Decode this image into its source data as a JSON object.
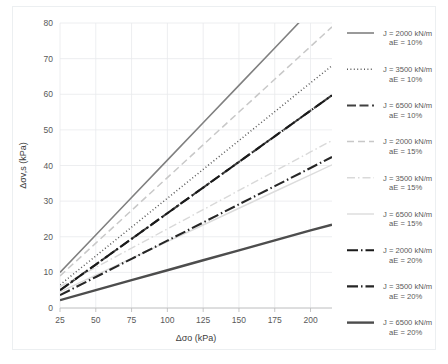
{
  "chart_data": {
    "type": "line",
    "title": "",
    "xlabel": "Δσo (kPa)",
    "ylabel": "Δσv,s (kPa)",
    "xlim": [
      25,
      215
    ],
    "ylim": [
      0,
      80
    ],
    "xticks": [
      25,
      50,
      75,
      100,
      125,
      150,
      175,
      200
    ],
    "yticks": [
      0,
      10,
      20,
      30,
      40,
      50,
      60,
      70,
      80
    ],
    "grid": true,
    "legend_position": "right",
    "x": [
      25,
      50,
      75,
      100,
      125,
      150,
      175,
      200,
      215
    ],
    "series": [
      {
        "name": "J = 2000 kN/m\naE = 10%",
        "label_line1": "J = 2000 kN/m",
        "label_line2": "aE = 10%",
        "color": "#808080",
        "width": 1.6,
        "dash": "none",
        "values": [
          10.0,
          20.5,
          31.0,
          41.5,
          52.0,
          62.5,
          73.0,
          83.5,
          89.8
        ],
        "clip_top": true
      },
      {
        "name": "J = 3500 kN/m\naE = 10%",
        "label_line1": "J = 3500 kN/m",
        "label_line2": "aE = 10%",
        "color": "#595959",
        "width": 1.5,
        "dash": "1,2.4",
        "values": [
          6.5,
          14.6,
          22.7,
          30.8,
          38.9,
          47.0,
          55.1,
          63.2,
          68.0
        ]
      },
      {
        "name": "J = 6500 kN/m\naE = 10%",
        "label_line1": "J = 6500 kN/m",
        "label_line2": "aE = 10%",
        "color": "#404040",
        "width": 2.0,
        "dash": "9,3.5",
        "values": [
          5.0,
          12.2,
          19.4,
          26.6,
          33.8,
          41.0,
          48.2,
          55.4,
          59.7
        ]
      },
      {
        "name": "J = 2000 kN/m\naE = 15%",
        "label_line1": "J = 2000 kN/m",
        "label_line2": "aE = 15%",
        "color": "#c8c8c8",
        "width": 1.5,
        "dash": "7,4",
        "values": [
          9.0,
          18.2,
          27.4,
          36.6,
          45.8,
          55.0,
          64.2,
          73.4,
          78.9
        ]
      },
      {
        "name": "J = 3500 kN/m\naE = 15%",
        "label_line1": "J = 3500 kN/m",
        "label_line2": "aE = 15%",
        "color": "#d9d9d9",
        "width": 1.4,
        "dash": "8,3,1.5,3",
        "values": [
          6.0,
          11.4,
          16.8,
          22.2,
          27.6,
          33.0,
          38.4,
          43.8,
          47.0
        ]
      },
      {
        "name": "J = 6500 kN/m\naE = 15%",
        "label_line1": "J = 6500 kN/m",
        "label_line2": "aE = 15%",
        "color": "#dcdcdc",
        "width": 1.4,
        "dash": "none",
        "values": [
          4.5,
          9.2,
          13.9,
          18.6,
          23.3,
          28.0,
          32.7,
          37.4,
          40.2
        ]
      },
      {
        "name": "J = 2000 kN/m\naE = 20%",
        "label_line1": "J = 2000 kN/m",
        "label_line2": "aE = 20%",
        "color": "#1a1a1a",
        "width": 2.1,
        "dash": "11,3,1.5,3",
        "values": [
          5.0,
          12.2,
          19.4,
          26.6,
          33.8,
          41.0,
          48.2,
          55.4,
          59.7
        ]
      },
      {
        "name": "J = 3500 kN/m\naE = 20%",
        "label_line1": "J = 3500 kN/m",
        "label_line2": "aE = 20%",
        "color": "#262626",
        "width": 2.1,
        "dash": "11,3,1.5,3",
        "values": [
          3.6,
          8.7,
          13.8,
          18.9,
          24.0,
          29.1,
          34.2,
          39.3,
          42.4
        ]
      },
      {
        "name": "J = 6500 kN/m\naE = 20%",
        "label_line1": "J = 6500 kN/m",
        "label_line2": "aE = 20%",
        "color": "#4d4d4d",
        "width": 2.4,
        "dash": "none",
        "values": [
          2.2,
          5.0,
          7.8,
          10.6,
          13.4,
          16.2,
          19.0,
          21.8,
          23.4
        ]
      }
    ]
  }
}
